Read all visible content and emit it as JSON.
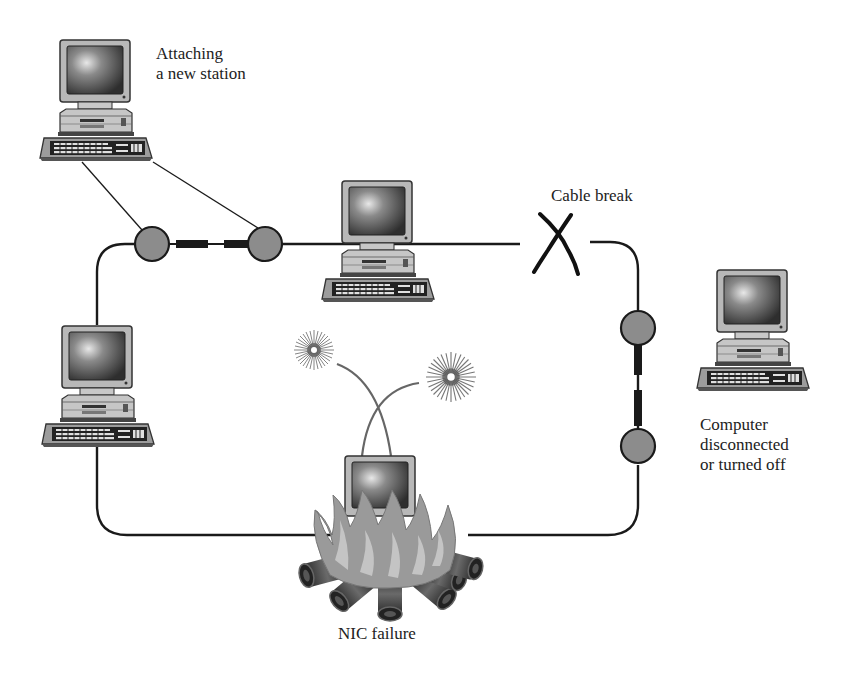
{
  "diagram": {
    "labels": {
      "attaching": [
        "Attaching",
        "a new station"
      ],
      "cable_break": "Cable break",
      "computer_off": [
        "Computer",
        "disconnected",
        "or turned off"
      ],
      "nic_failure": "NIC failure"
    },
    "nodes": [
      {
        "id": "new-station",
        "role": "Attaching a new station",
        "x": 40,
        "y": 40
      },
      {
        "id": "ring-top",
        "role": "ring member",
        "x": 322,
        "y": 180
      },
      {
        "id": "ring-left",
        "role": "ring member",
        "x": 42,
        "y": 325
      },
      {
        "id": "ring-right-off",
        "role": "Computer disconnected or turned off",
        "x": 697,
        "y": 270
      },
      {
        "id": "nic-failed",
        "role": "NIC failure",
        "x": 345,
        "y": 455
      }
    ],
    "connectors": [
      {
        "id": "connector-top-left",
        "cx": 152,
        "cy": 244
      },
      {
        "id": "connector-top-right",
        "cx": 265,
        "cy": 244
      },
      {
        "id": "connector-right-upper",
        "cx": 638,
        "cy": 328
      },
      {
        "id": "connector-right-lower",
        "cx": 638,
        "cy": 446
      }
    ],
    "colors": {
      "connector_fill": "#8c8c8c",
      "line": "#1a1a1a",
      "flame_outer": "#9a9a9a",
      "flame_inner": "#c4c4c4",
      "computer_body": "#bdbdbd",
      "screen": "#555555"
    }
  }
}
